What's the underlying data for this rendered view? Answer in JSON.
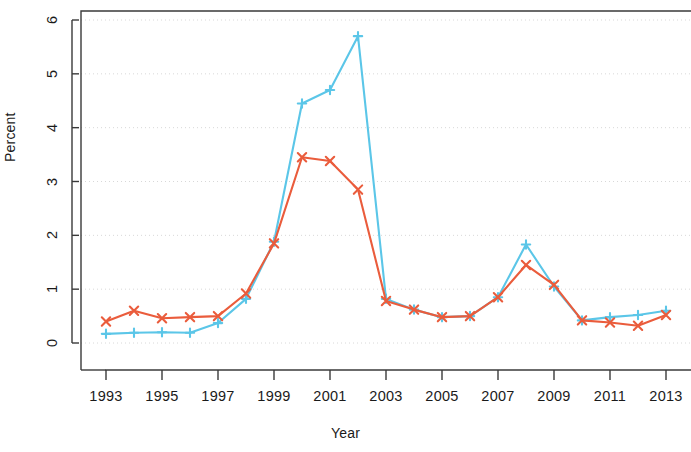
{
  "chart_data": {
    "type": "line",
    "title": "",
    "xlabel": "Year",
    "ylabel": "Percent",
    "xlim": [
      1992.5,
      2013.5
    ],
    "ylim": [
      0,
      6.2
    ],
    "grid": true,
    "legend": "none",
    "x": [
      1993,
      1994,
      1995,
      1996,
      1997,
      1998,
      1999,
      2000,
      2001,
      2002,
      2003,
      2004,
      2005,
      2006,
      2007,
      2008,
      2009,
      2010,
      2011,
      2012,
      2013
    ],
    "xticks": [
      1993,
      1995,
      1997,
      1999,
      2001,
      2003,
      2005,
      2007,
      2009,
      2011,
      2013
    ],
    "xtick_labels": [
      "1993",
      "1995",
      "1997",
      "1999",
      "2001",
      "2003",
      "2005",
      "2007",
      "2009",
      "2011",
      "2013"
    ],
    "yticks": [
      0,
      1,
      2,
      3,
      4,
      5,
      6
    ],
    "ytick_labels": [
      "0",
      "1",
      "2",
      "3",
      "4",
      "5",
      "6"
    ],
    "series": [
      {
        "name": "red-series",
        "color": "#ea5c3c",
        "marker": "x",
        "values": [
          0.4,
          0.6,
          0.46,
          0.48,
          0.5,
          0.92,
          1.85,
          3.45,
          3.38,
          2.85,
          0.78,
          0.62,
          0.48,
          0.5,
          0.85,
          1.45,
          1.08,
          0.42,
          0.38,
          0.32,
          0.52
        ]
      },
      {
        "name": "blue-series",
        "color": "#5bc6e8",
        "marker": "+",
        "values": [
          0.17,
          0.19,
          0.2,
          0.19,
          0.37,
          0.82,
          1.88,
          4.45,
          4.7,
          5.7,
          0.82,
          0.62,
          0.48,
          0.5,
          0.85,
          1.83,
          1.05,
          0.42,
          0.48,
          0.52,
          0.6
        ]
      }
    ]
  },
  "axes": {
    "ylabel_text": "Percent",
    "xlabel_text": "Year"
  }
}
